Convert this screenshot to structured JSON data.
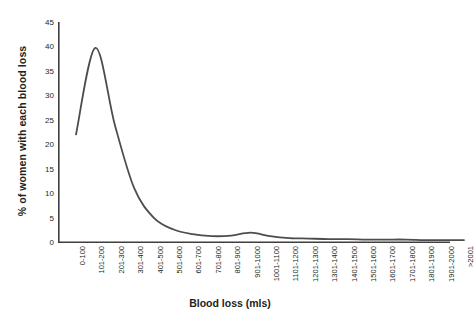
{
  "chart_data": {
    "type": "line",
    "title": "",
    "xlabel": "Blood loss (mls)",
    "ylabel": "% of women with each blood loss",
    "ylim": [
      0,
      45
    ],
    "ytick_step": 5,
    "yticks": [
      0,
      5,
      10,
      15,
      20,
      25,
      30,
      35,
      40,
      45
    ],
    "grid": false,
    "legend": "none",
    "line_color": "#4d4d4d",
    "axis_color": "#3f3f3f",
    "background": "#ffffff",
    "categories": [
      "0-100",
      "101-200",
      "201-300",
      "301-400",
      "401-500",
      "501-600",
      "601-700",
      "701-800",
      "801-900",
      "901-1000",
      "1001-1100",
      "1101-1200",
      "1201-1300",
      "1301-1400",
      "1401-1500",
      "1501-1600",
      "1601-1700",
      "1701-1800",
      "1801-1900",
      "1901-2000",
      ">2001"
    ],
    "series": [
      {
        "name": "% of women with each blood loss",
        "values": [
          22.0,
          39.7,
          24.0,
          11.0,
          5.0,
          2.6,
          1.6,
          1.2,
          1.3,
          1.9,
          1.2,
          0.8,
          0.7,
          0.6,
          0.6,
          0.5,
          0.5,
          0.5,
          0.4,
          0.4,
          0.4
        ]
      }
    ],
    "annotations": [
      "Peak of approximately 40% occurs in the 101-200 mls category",
      "Small secondary bump of approximately 2% near the 901-1000 mls category"
    ]
  },
  "caption": {
    "text": ""
  }
}
